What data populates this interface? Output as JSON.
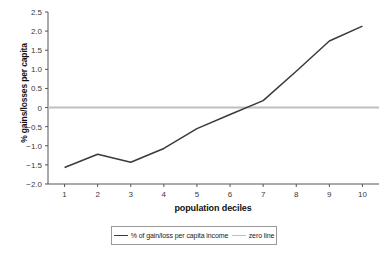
{
  "chart_data": {
    "type": "line",
    "title": "",
    "xlabel": "population deciles",
    "ylabel": "% gains/losses per capita",
    "categories": [
      "1",
      "2",
      "3",
      "4",
      "5",
      "6",
      "7",
      "8",
      "9",
      "10"
    ],
    "x": [
      1,
      2,
      3,
      4,
      5,
      6,
      7,
      8,
      9,
      10
    ],
    "series": [
      {
        "name": "% of gain/loss per capita income",
        "color": "#3a3a3a",
        "values": [
          -1.57,
          -1.22,
          -1.43,
          -1.07,
          -0.55,
          -0.18,
          0.18,
          0.95,
          1.74,
          2.13
        ]
      },
      {
        "name": "zero line",
        "color": "#bfbfbf",
        "values": [
          0,
          0,
          0,
          0,
          0,
          0,
          0,
          0,
          0,
          0
        ]
      }
    ],
    "ylim": [
      -2.0,
      2.5
    ],
    "xlim": [
      0.5,
      10.5
    ],
    "yticks": [
      2.5,
      2.0,
      1.5,
      1.0,
      0.5,
      0,
      -0.5,
      -1.0,
      -1.5,
      -2.0
    ],
    "ytick_labels": [
      "2.5",
      "2.0",
      "1.5",
      "1.0",
      "0.5",
      "0",
      "−0.5",
      "−1.0",
      "−1.5",
      "−2.0"
    ],
    "xtick_labels": [
      "1",
      "2",
      "3",
      "4",
      "5",
      "6",
      "7",
      "8",
      "9",
      "10"
    ],
    "grid": false,
    "legend_position": "bottom-center"
  },
  "axes": {
    "y_title": "% gains/losses per capita",
    "x_title": "population deciles"
  },
  "legend": {
    "items": [
      {
        "label": "% of gain/loss per capita income",
        "color": "#3a3a3a"
      },
      {
        "label": "zero line",
        "color": "#bfbfbf"
      }
    ]
  }
}
